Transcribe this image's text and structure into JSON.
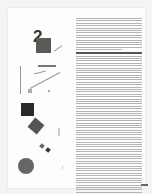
{
  "page": {
    "figure": {
      "numeral": "2",
      "shapes": [
        "square-top",
        "square-black",
        "square-rotated",
        "small-squares",
        "circle"
      ]
    },
    "text_column": {
      "paragraph_lines_top": 24,
      "paragraph_lines_bottom": 80,
      "legible": false
    },
    "colors": {
      "ink": "#333333",
      "shape_fill": "#555555",
      "paper": "#fdfdfb"
    }
  }
}
